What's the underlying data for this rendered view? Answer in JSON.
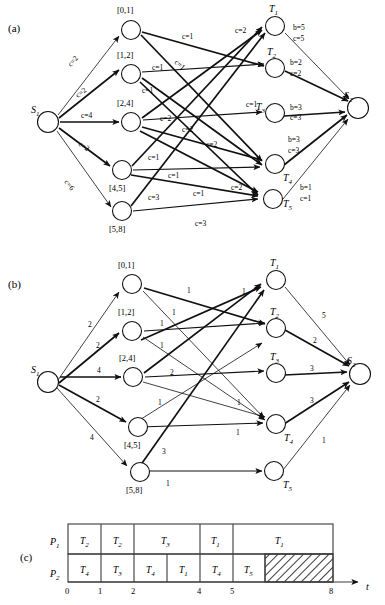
{
  "figure": {
    "panels": [
      {
        "id": "a",
        "label": "(a)"
      },
      {
        "id": "b",
        "label": "(b)"
      },
      {
        "id": "c",
        "label": "(c)"
      }
    ]
  },
  "panel_a": {
    "label": "(a)",
    "source": {
      "name": "S",
      "sub": "1"
    },
    "sink": {
      "name": "S",
      "sub": "2"
    },
    "middle_nodes": [
      {
        "id": "m1",
        "label": "[0,1]"
      },
      {
        "id": "m2",
        "label": "[1,2]"
      },
      {
        "id": "m3",
        "label": "[2,4]"
      },
      {
        "id": "m4",
        "label": "[4,5]"
      },
      {
        "id": "m5",
        "label": "[5,8]"
      }
    ],
    "task_nodes": [
      {
        "id": "T1",
        "name": "T",
        "sub": "1"
      },
      {
        "id": "T2",
        "name": "T",
        "sub": "2"
      },
      {
        "id": "T3",
        "name": "T",
        "sub": "3"
      },
      {
        "id": "T4",
        "name": "T",
        "sub": "4"
      },
      {
        "id": "T5",
        "name": "T",
        "sub": "5"
      }
    ],
    "source_edge_labels": [
      "c=2",
      "c=2",
      "c=4",
      "c=2",
      "c=6"
    ],
    "middle_edge_labels": [
      "c=1",
      "c=1",
      "c=1",
      "c=1",
      "c=2",
      "c=1",
      "c=2",
      "c=1",
      "c=2",
      "c=2",
      "c=1",
      "c=1",
      "c=3",
      "c=2",
      "c=3"
    ],
    "sink_edge_labels": [
      {
        "b": "b=5",
        "c": "c=5"
      },
      {
        "b": "b=2",
        "c": "c=2"
      },
      {
        "b": "b=3",
        "c": "c=3"
      },
      {
        "b": "b=3",
        "c": "c=3"
      },
      {
        "b": "b=1",
        "c": "c=1"
      }
    ]
  },
  "panel_b": {
    "label": "(b)",
    "source": {
      "name": "S",
      "sub": "1"
    },
    "sink": {
      "name": "S",
      "sub": "2"
    },
    "middle_nodes": [
      {
        "id": "m1",
        "label": "[0,1]"
      },
      {
        "id": "m2",
        "label": "[1,2]"
      },
      {
        "id": "m3",
        "label": "[2,4]"
      },
      {
        "id": "m4",
        "label": "[4,5]"
      },
      {
        "id": "m5",
        "label": "[5,8]"
      }
    ],
    "task_nodes": [
      {
        "id": "T1",
        "name": "T",
        "sub": "1"
      },
      {
        "id": "T2",
        "name": "T",
        "sub": "2"
      },
      {
        "id": "T3",
        "name": "T",
        "sub": "3"
      },
      {
        "id": "T4",
        "name": "T",
        "sub": "4"
      },
      {
        "id": "T5",
        "name": "T",
        "sub": "5"
      }
    ],
    "source_edge_labels": [
      "2",
      "2",
      "4",
      "2",
      "4"
    ],
    "middle_edge_labels": [
      "1",
      "1",
      "1",
      "1",
      "1",
      "2",
      "1",
      "1",
      "1",
      "3",
      "1"
    ],
    "sink_edge_labels": [
      "5",
      "2",
      "3",
      "3",
      "1"
    ]
  },
  "panel_c": {
    "label": "(c)",
    "rows": [
      {
        "name": "P",
        "sub": "1",
        "cells": [
          {
            "name": "T",
            "sub": "2",
            "start": 0,
            "end": 1,
            "hatched": false
          },
          {
            "name": "T",
            "sub": "2",
            "start": 1,
            "end": 2,
            "hatched": false
          },
          {
            "name": "T",
            "sub": "3",
            "start": 2,
            "end": 4,
            "hatched": false
          },
          {
            "name": "T",
            "sub": "1",
            "start": 4,
            "end": 5,
            "hatched": false
          },
          {
            "name": "T",
            "sub": "1",
            "start": 5,
            "end": 8,
            "hatched": false
          }
        ]
      },
      {
        "name": "P",
        "sub": "2",
        "cells": [
          {
            "name": "T",
            "sub": "4",
            "start": 0,
            "end": 1,
            "hatched": false
          },
          {
            "name": "T",
            "sub": "3",
            "start": 1,
            "end": 2,
            "hatched": false
          },
          {
            "name": "T",
            "sub": "4",
            "start": 2,
            "end": 3,
            "hatched": false
          },
          {
            "name": "T",
            "sub": "1",
            "start": 3,
            "end": 4,
            "hatched": false
          },
          {
            "name": "T",
            "sub": "4",
            "start": 4,
            "end": 5,
            "hatched": false
          },
          {
            "name": "T",
            "sub": "5",
            "start": 5,
            "end": 6,
            "hatched": false
          },
          {
            "name": "",
            "sub": "",
            "start": 6,
            "end": 8,
            "hatched": true
          }
        ]
      }
    ],
    "axis": {
      "ticks": [
        "0",
        "1",
        "2",
        "4",
        "5",
        "8"
      ],
      "tick_values": [
        0,
        1,
        2,
        4,
        5,
        8
      ],
      "axis_label": "t"
    }
  },
  "colors": {
    "ink": "#111111",
    "paper": "#ffffff",
    "gantt_stroke": "#3b3b3b"
  }
}
